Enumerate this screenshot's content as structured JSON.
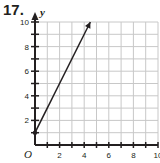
{
  "problem": {
    "number": "17."
  },
  "colors": {
    "grid": "#c8c8c8",
    "axis": "#231f20",
    "line": "#231f20"
  },
  "chart_data": {
    "type": "line",
    "title": "",
    "xlabel": "",
    "ylabel": "y",
    "origin_label": "O",
    "xlim": [
      0,
      10
    ],
    "ylim": [
      0,
      10
    ],
    "grid": true,
    "x_ticks": [
      2,
      4,
      6,
      8,
      10
    ],
    "y_ticks": [
      2,
      4,
      6,
      8,
      10
    ],
    "x_tick_labels": [
      "2",
      "4",
      "6",
      "8",
      "10"
    ],
    "y_tick_labels": [
      "2",
      "4",
      "6",
      "8",
      "10"
    ],
    "series": [
      {
        "name": "line",
        "x": [
          0,
          4.5
        ],
        "y": [
          1,
          10
        ],
        "start_point": [
          0,
          1
        ],
        "arrow_end": true,
        "equation": "y = 2x + 1"
      }
    ]
  }
}
